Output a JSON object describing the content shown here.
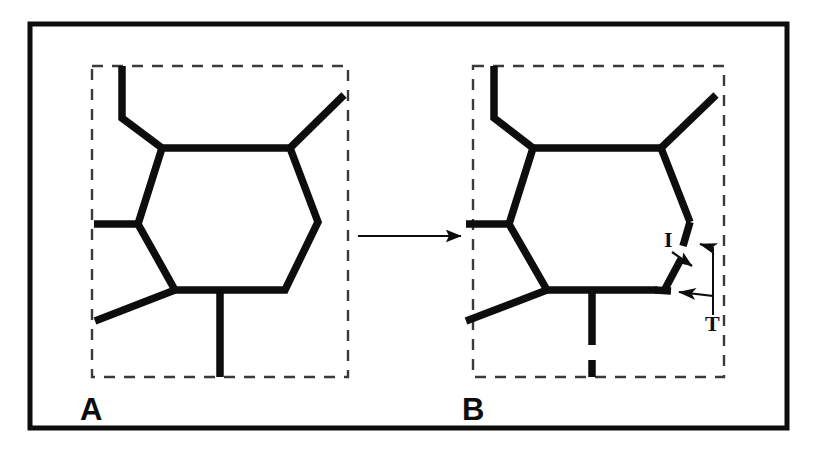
{
  "figure": {
    "background_color": "#ffffff",
    "ink_color": "#0d0d0d",
    "frame": {
      "name": "outer-border",
      "x": 30,
      "y": 24,
      "width": 757,
      "height": 404,
      "stroke_width": 5
    },
    "transition_arrow": {
      "label": "",
      "x1": 358,
      "y1": 236,
      "x2": 466,
      "y2": 236,
      "stroke_width": 2
    }
  },
  "panels": [
    {
      "id": "panel-a",
      "letter": "A",
      "letter_x": 80,
      "letter_y": 420,
      "dashed_box": {
        "x": 92,
        "y": 66,
        "width": 256,
        "height": 311
      },
      "description": "Intact hexagonal ring with four pendant bonds, no breaks",
      "ring_vertices": [
        [
          162,
          148
        ],
        [
          290,
          148
        ],
        [
          318,
          222
        ],
        [
          285,
          290
        ],
        [
          175,
          290
        ],
        [
          138,
          224
        ]
      ],
      "substituents": [
        {
          "name": "top-left-stub",
          "points": [
            [
              162,
              148
            ],
            [
              122,
              118
            ],
            [
              122,
              66
            ]
          ]
        },
        {
          "name": "top-right-stub",
          "points": [
            [
              290,
              148
            ],
            [
              344,
              95
            ]
          ]
        },
        {
          "name": "left-stub",
          "points": [
            [
              138,
              224
            ],
            [
              94,
              224
            ]
          ]
        },
        {
          "name": "lower-left-stub",
          "points": [
            [
              175,
              290
            ],
            [
              95,
              321
            ]
          ]
        },
        {
          "name": "bottom-stub",
          "points": [
            [
              220,
              290
            ],
            [
              220,
              377
            ]
          ]
        }
      ],
      "breaks": []
    },
    {
      "id": "panel-b",
      "letter": "B",
      "letter_x": 462,
      "letter_y": 420,
      "dashed_box": {
        "x": 473,
        "y": 66,
        "width": 251,
        "height": 311
      },
      "description": "Same ring after cleavage: right-hand bond is fragmented into an intermediate piece with two terminal ends",
      "ring_vertices": [
        [
          533,
          148
        ],
        [
          661,
          148
        ],
        [
          690,
          222
        ],
        [
          657,
          290
        ],
        [
          547,
          290
        ],
        [
          509,
          224
        ]
      ],
      "substituents": [
        {
          "name": "top-left-stub",
          "points": [
            [
              533,
              148
            ],
            [
              494,
              118
            ],
            [
              494,
              66
            ]
          ]
        },
        {
          "name": "top-right-stub",
          "points": [
            [
              661,
              148
            ],
            [
              716,
              95
            ]
          ]
        },
        {
          "name": "left-stub",
          "points": [
            [
              509,
              224
            ],
            [
              466,
              224
            ]
          ]
        },
        {
          "name": "lower-left-stub",
          "points": [
            [
              547,
              290
            ],
            [
              466,
              321
            ]
          ]
        },
        {
          "name": "bottom-stub",
          "points": [
            [
              592,
              290
            ],
            [
              592,
              345
            ]
          ]
        }
      ],
      "breaks": [
        {
          "name": "broken-right-bond-upper",
          "points": [
            [
              690,
              222
            ],
            [
              684,
              244
            ]
          ]
        },
        {
          "name": "broken-bond-fragment",
          "points": [
            [
              680,
              258
            ],
            [
              665,
              288
            ]
          ]
        },
        {
          "name": "broken-right-bond-lower",
          "points": [
            [
              657,
              290
            ],
            [
              668,
              291
            ]
          ]
        },
        {
          "name": "broken-bottom-stub-tick",
          "points": [
            [
              592,
              361
            ],
            [
              592,
              377
            ]
          ]
        }
      ]
    }
  ],
  "annotations": [
    {
      "name": "label-i",
      "text": "I",
      "meaning": "intermediate fragment",
      "text_x": 664,
      "text_y": 247,
      "arrow": {
        "x1": 672,
        "y1": 252,
        "x2": 692,
        "y2": 266
      }
    },
    {
      "name": "label-t",
      "text": "T",
      "meaning": "terminal ends",
      "text_x": 713,
      "text_y": 327,
      "arrow_upper": {
        "path": "M 716 318 L 716 248 L 697 243"
      },
      "arrow_lower": {
        "path": "M 716 318 L 716 297 L 673 292"
      }
    }
  ]
}
